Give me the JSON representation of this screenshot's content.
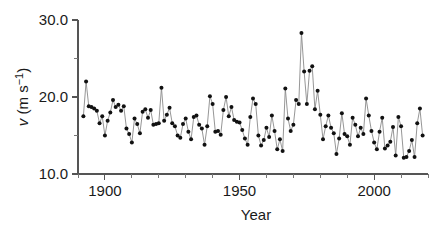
{
  "chart_data": {
    "type": "line",
    "title": "",
    "xlabel": "Year",
    "ylabel": "v (m s-1)",
    "ylabel_parts": {
      "italic_symbol": "v",
      "units": " (m s",
      "exponent": "−1",
      "close": ")"
    },
    "xlim": [
      1890,
      2020
    ],
    "ylim": [
      10.0,
      30.0
    ],
    "grid": false,
    "legend": null,
    "x_major_ticks": [
      1900,
      1950,
      2000
    ],
    "x_major_tick_labels": [
      "1900",
      "1950",
      "2000"
    ],
    "x_minor_ticks": [
      1890,
      1910,
      1920,
      1930,
      1940,
      1960,
      1970,
      1980,
      1990,
      2010,
      2020
    ],
    "y_major_ticks": [
      10.0,
      20.0,
      30.0
    ],
    "y_major_tick_labels": [
      "10.0",
      "20.0",
      "30.0"
    ],
    "y_minor_ticks": [
      15.0,
      25.0
    ],
    "marker": "filled-circle",
    "marker_color": "#111111",
    "line_color": "#8a8a8a",
    "x": [
      1892,
      1893,
      1894,
      1895,
      1896,
      1897,
      1898,
      1899,
      1900,
      1901,
      1902,
      1903,
      1904,
      1905,
      1906,
      1907,
      1908,
      1909,
      1910,
      1911,
      1912,
      1913,
      1914,
      1915,
      1916,
      1917,
      1918,
      1919,
      1920,
      1921,
      1922,
      1923,
      1924,
      1925,
      1926,
      1927,
      1928,
      1929,
      1930,
      1931,
      1932,
      1933,
      1934,
      1935,
      1936,
      1937,
      1938,
      1939,
      1940,
      1941,
      1942,
      1943,
      1944,
      1945,
      1946,
      1947,
      1948,
      1949,
      1950,
      1951,
      1952,
      1953,
      1954,
      1955,
      1956,
      1957,
      1958,
      1959,
      1960,
      1961,
      1962,
      1963,
      1964,
      1965,
      1966,
      1967,
      1968,
      1969,
      1970,
      1971,
      1972,
      1973,
      1974,
      1975,
      1976,
      1977,
      1978,
      1979,
      1980,
      1981,
      1982,
      1983,
      1984,
      1985,
      1986,
      1987,
      1988,
      1989,
      1990,
      1991,
      1992,
      1993,
      1994,
      1995,
      1996,
      1997,
      1998,
      1999,
      2000,
      2001,
      2002,
      2003,
      2004,
      2005,
      2006,
      2007,
      2008,
      2009,
      2010,
      2011,
      2012,
      2013,
      2014,
      2015,
      2016,
      2017,
      2018
    ],
    "values": [
      17.5,
      22.0,
      18.8,
      18.7,
      18.5,
      18.2,
      16.6,
      17.5,
      15.0,
      16.9,
      18.0,
      19.6,
      18.7,
      19.0,
      18.2,
      18.8,
      15.9,
      15.2,
      14.1,
      17.2,
      16.5,
      15.3,
      18.1,
      18.4,
      17.3,
      18.3,
      16.4,
      16.5,
      16.6,
      21.2,
      16.9,
      17.7,
      18.6,
      16.6,
      16.2,
      15.0,
      14.7,
      16.5,
      17.2,
      15.5,
      14.5,
      17.4,
      17.6,
      16.4,
      15.9,
      13.8,
      16.2,
      20.1,
      19.1,
      15.5,
      15.6,
      15.1,
      18.3,
      20.0,
      17.5,
      18.7,
      17.0,
      16.8,
      16.7,
      15.7,
      14.6,
      13.8,
      17.4,
      19.8,
      19.1,
      15.0,
      13.7,
      14.4,
      16.0,
      14.8,
      17.6,
      15.6,
      13.2,
      14.5,
      13.0,
      21.1,
      17.2,
      15.6,
      16.4,
      19.6,
      19.1,
      28.3,
      23.3,
      19.1,
      23.4,
      24.0,
      18.4,
      20.8,
      17.7,
      14.5,
      16.2,
      17.6,
      16.0,
      15.3,
      12.6,
      14.6,
      17.9,
      15.2,
      14.9,
      13.8,
      17.3,
      16.4,
      14.9,
      16.0,
      15.2,
      19.8,
      17.6,
      15.6,
      14.1,
      13.2,
      15.5,
      17.3,
      13.3,
      13.7,
      14.2,
      16.1,
      12.4,
      17.4,
      16.2,
      12.1,
      12.2,
      13.0,
      14.4,
      12.2,
      16.6,
      18.5,
      15.0
    ]
  },
  "layout": {
    "plot_left_px": 78,
    "plot_right_px": 428,
    "plot_top_px": 20,
    "plot_bottom_px": 174
  }
}
